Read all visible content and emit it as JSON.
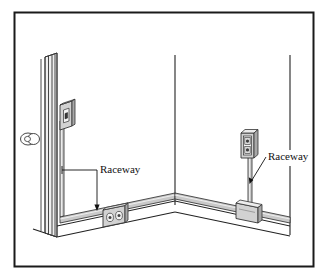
{
  "figure": {
    "border_color": "#1a1a1a",
    "line_color": "#222222",
    "raceway_fill": "#c9c9c9",
    "box_fill": "#d2d2d2",
    "box_shade": "#a8a8a8",
    "background": "#ffffff"
  },
  "labels": [
    {
      "id": "label-raceway-left",
      "text": "Raceway",
      "x": 100,
      "y": 173,
      "anchor": "start"
    },
    {
      "id": "label-raceway-right",
      "text": "Raceway",
      "x": 268,
      "y": 160,
      "anchor": "start"
    }
  ],
  "components": [
    {
      "id": "door-frame",
      "name": "door-frame",
      "wall": "left"
    },
    {
      "id": "door-knob",
      "name": "door-knob",
      "wall": "left"
    },
    {
      "id": "switch-box",
      "name": "switch-box",
      "wall": "left",
      "devices": 1
    },
    {
      "id": "raceway-vertical-left",
      "name": "raceway-vertical-left",
      "wall": "left"
    },
    {
      "id": "raceway-baseboard-left",
      "name": "raceway-baseboard-left",
      "wall": "left"
    },
    {
      "id": "receptacle-box-left",
      "name": "receptacle-box-left",
      "wall": "left",
      "devices": 2
    },
    {
      "id": "receptacle-box-right",
      "name": "receptacle-box-right",
      "wall": "right",
      "devices": 2
    },
    {
      "id": "raceway-vertical-right",
      "name": "raceway-vertical-right",
      "wall": "right"
    },
    {
      "id": "junction-box-right",
      "name": "junction-box-right",
      "wall": "right"
    },
    {
      "id": "raceway-baseboard-right",
      "name": "raceway-baseboard-right",
      "wall": "right"
    }
  ]
}
